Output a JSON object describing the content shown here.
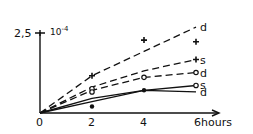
{
  "chart_data": {
    "type": "line",
    "title": "",
    "xlabel": "hours",
    "ylabel": "",
    "y_scale_label": "10^-4",
    "y_top_label": "2,5",
    "origin_label": "0",
    "x_ticks": [
      "2",
      "4",
      "6"
    ],
    "xlim": [
      0,
      6.5
    ],
    "ylim": [
      0,
      2.5
    ],
    "grid": false,
    "legend": "inline labels at line ends",
    "series": [
      {
        "name": "d (upper dashed)",
        "label": "d",
        "style": "dashed",
        "x": [
          0,
          2,
          4,
          6
        ],
        "y": [
          0,
          1.15,
          1.9,
          2.65
        ]
      },
      {
        "name": "s (upper dashed)",
        "label": "s",
        "style": "dashed",
        "x": [
          0,
          2,
          4,
          6
        ],
        "y": [
          0,
          0.8,
          1.3,
          1.65
        ]
      },
      {
        "name": "d (lower dashed)",
        "label": "d",
        "style": "dashed",
        "x": [
          0,
          2,
          4,
          6
        ],
        "y": [
          0,
          0.7,
          1.1,
          1.25
        ]
      },
      {
        "name": "s (solid)",
        "label": "s",
        "style": "solid",
        "x": [
          0,
          2,
          4,
          6
        ],
        "y": [
          0,
          0.45,
          0.7,
          0.85
        ]
      },
      {
        "name": "d (solid)",
        "label": "d",
        "style": "solid",
        "x": [
          0,
          2,
          4,
          6
        ],
        "y": [
          0,
          0.35,
          0.7,
          0.65
        ]
      }
    ],
    "points": [
      {
        "x": 2,
        "y": 1.15,
        "marker": "star"
      },
      {
        "x": 4,
        "y": 2.25,
        "marker": "star"
      },
      {
        "x": 6,
        "y": 2.2,
        "marker": "star"
      },
      {
        "x": 6,
        "y": 1.65,
        "marker": "star"
      },
      {
        "x": 2,
        "y": 0.75,
        "marker": "circle"
      },
      {
        "x": 2,
        "y": 0.65,
        "marker": "circle"
      },
      {
        "x": 4,
        "y": 1.1,
        "marker": "circle"
      },
      {
        "x": 6,
        "y": 1.25,
        "marker": "circle"
      },
      {
        "x": 6,
        "y": 0.85,
        "marker": "circle"
      },
      {
        "x": 2,
        "y": 0.2,
        "marker": "filled"
      },
      {
        "x": 4,
        "y": 0.7,
        "marker": "filled"
      }
    ]
  }
}
